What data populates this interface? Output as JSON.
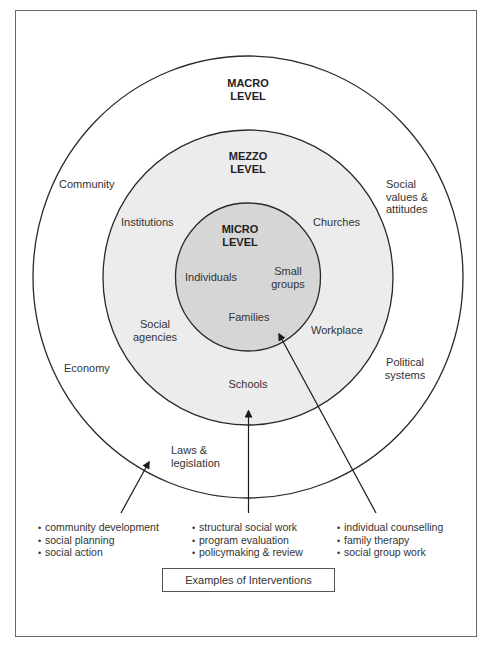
{
  "diagram": {
    "type": "nested-circles",
    "colors": {
      "outline": "#2a2a2a",
      "macro_fill": "#ffffff",
      "mezzo_fill": "#ececec",
      "micro_fill": "#d6d6d6",
      "frame": "#6a6a6a"
    },
    "levels": {
      "macro": {
        "title_line1": "MACRO",
        "title_line2": "LEVEL",
        "items": {
          "community": "Community",
          "social_values_line1": "Social",
          "social_values_line2": "values &",
          "social_values_line3": "attitudes",
          "economy": "Economy",
          "political_line1": "Political",
          "political_line2": "systems",
          "laws_line1": "Laws &",
          "laws_line2": "legislation"
        }
      },
      "mezzo": {
        "title_line1": "MEZZO",
        "title_line2": "LEVEL",
        "items": {
          "institutions": "Institutions",
          "churches": "Churches",
          "social_agencies_line1": "Social",
          "social_agencies_line2": "agencies",
          "workplace": "Workplace",
          "schools": "Schools"
        }
      },
      "micro": {
        "title_line1": "MICRO",
        "title_line2": "LEVEL",
        "items": {
          "individuals": "Individuals",
          "small_groups_line1": "Small",
          "small_groups_line2": "groups",
          "families": "Families"
        }
      }
    },
    "interventions": {
      "macro": [
        "community development",
        "social planning",
        "social action"
      ],
      "mezzo": [
        "structural social work",
        "program evaluation",
        "policymaking & review"
      ],
      "micro": [
        "individual counselling",
        "family therapy",
        "social group work"
      ]
    },
    "caption": "Examples of Interventions"
  }
}
